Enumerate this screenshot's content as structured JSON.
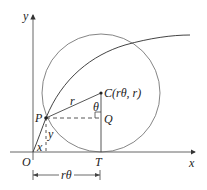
{
  "diagram": {
    "labels": {
      "y_axis": "y",
      "x_axis": "x",
      "origin": "O",
      "point_p": "P",
      "point_c": "C(rθ, r)",
      "point_q": "Q",
      "point_t": "T",
      "radius": "r",
      "angle": "θ",
      "x_len": "x",
      "y_len": "y",
      "arc_length": "rθ"
    },
    "colors": {
      "line": "#333333",
      "curve": "#444444",
      "circle": "#666666"
    }
  }
}
